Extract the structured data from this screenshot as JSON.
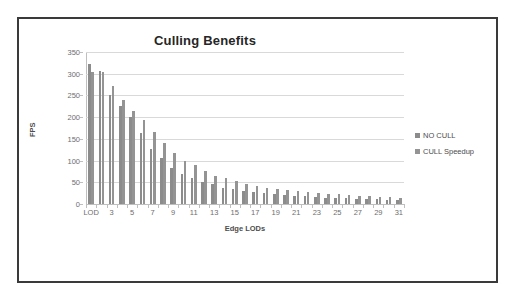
{
  "figure": {
    "title": "Culling Benefits",
    "xlabel": "Edge LODs",
    "ylabel": "FPS"
  },
  "legend": {
    "items": [
      {
        "label": "NO CULL",
        "color": "#8c8c8c"
      },
      {
        "label": "CULL Speedup",
        "color": "#949494"
      }
    ]
  },
  "chart_data": {
    "type": "bar",
    "title": "Culling Benefits",
    "xlabel": "Edge LODs",
    "ylabel": "FPS",
    "ylim": [
      0,
      350
    ],
    "ytick_step": 50,
    "yticks": [
      0,
      50,
      100,
      150,
      200,
      250,
      300,
      350
    ],
    "grid": true,
    "legend_position": "right",
    "categories": [
      "LOD",
      "2",
      "3",
      "4",
      "5",
      "6",
      "7",
      "8",
      "9",
      "10",
      "11",
      "12",
      "13",
      "14",
      "15",
      "16",
      "17",
      "18",
      "19",
      "20",
      "21",
      "22",
      "23",
      "24",
      "25",
      "26",
      "27",
      "28",
      "29",
      "30",
      "31"
    ],
    "tick_labels": [
      "LOD",
      "",
      "3",
      "",
      "5",
      "",
      "7",
      "",
      "9",
      "",
      "11",
      "",
      "13",
      "",
      "15",
      "",
      "17",
      "",
      "19",
      "",
      "21",
      "",
      "23",
      "",
      "25",
      "",
      "27",
      "",
      "29",
      "",
      "31"
    ],
    "series": [
      {
        "name": "NO CULL",
        "color": "#8c8c8c",
        "values": [
          322,
          306,
          251,
          226,
          201,
          163,
          127,
          105,
          84,
          69,
          59,
          51,
          45,
          38,
          35,
          31,
          28,
          25,
          23,
          21,
          19,
          18,
          16,
          15,
          14,
          13,
          12,
          11,
          11,
          10,
          10
        ]
      },
      {
        "name": "CULL Speedup",
        "color": "#949494",
        "values": [
          305,
          303,
          271,
          240,
          215,
          193,
          165,
          140,
          118,
          100,
          89,
          75,
          65,
          59,
          52,
          47,
          42,
          37,
          34,
          32,
          30,
          28,
          25,
          24,
          22,
          20,
          19,
          18,
          17,
          16,
          15
        ]
      }
    ]
  }
}
